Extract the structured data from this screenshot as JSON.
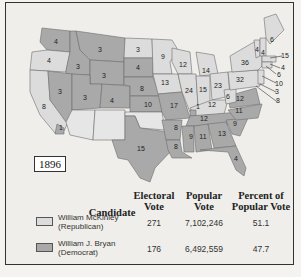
{
  "map": {
    "year_label": "1896",
    "states": [
      {
        "state": "WA",
        "ev": "4",
        "party": "dem"
      },
      {
        "state": "OR",
        "ev": "4",
        "party": "rep"
      },
      {
        "state": "CA",
        "ev": "8",
        "party": "rep"
      },
      {
        "state": "CA-split",
        "ev": "1",
        "party": "dem"
      },
      {
        "state": "ID",
        "ev": "3",
        "party": "dem"
      },
      {
        "state": "NV",
        "ev": "3",
        "party": "dem"
      },
      {
        "state": "MT",
        "ev": "3",
        "party": "dem"
      },
      {
        "state": "WY",
        "ev": "3",
        "party": "dem"
      },
      {
        "state": "UT",
        "ev": "3",
        "party": "dem"
      },
      {
        "state": "CO",
        "ev": "4",
        "party": "dem"
      },
      {
        "state": "ND",
        "ev": "3",
        "party": "rep"
      },
      {
        "state": "SD",
        "ev": "4",
        "party": "dem"
      },
      {
        "state": "NE",
        "ev": "8",
        "party": "dem"
      },
      {
        "state": "KS",
        "ev": "10",
        "party": "dem"
      },
      {
        "state": "TX",
        "ev": "15",
        "party": "dem"
      },
      {
        "state": "MN",
        "ev": "9",
        "party": "rep"
      },
      {
        "state": "IA",
        "ev": "13",
        "party": "rep"
      },
      {
        "state": "MO",
        "ev": "17",
        "party": "dem"
      },
      {
        "state": "AR",
        "ev": "8",
        "party": "dem"
      },
      {
        "state": "LA",
        "ev": "8",
        "party": "dem"
      },
      {
        "state": "WI",
        "ev": "12",
        "party": "rep"
      },
      {
        "state": "IL",
        "ev": "24",
        "party": "rep"
      },
      {
        "state": "MI",
        "ev": "14",
        "party": "rep"
      },
      {
        "state": "IN",
        "ev": "15",
        "party": "rep"
      },
      {
        "state": "OH",
        "ev": "23",
        "party": "rep"
      },
      {
        "state": "KY",
        "ev": "12",
        "party": "rep"
      },
      {
        "state": "KY-split",
        "ev": "1",
        "party": "dem"
      },
      {
        "state": "TN",
        "ev": "12",
        "party": "dem"
      },
      {
        "state": "MS",
        "ev": "9",
        "party": "dem"
      },
      {
        "state": "AL",
        "ev": "11",
        "party": "dem"
      },
      {
        "state": "GA",
        "ev": "13",
        "party": "dem"
      },
      {
        "state": "FL",
        "ev": "4",
        "party": "dem"
      },
      {
        "state": "SC",
        "ev": "9",
        "party": "dem"
      },
      {
        "state": "NC",
        "ev": "11",
        "party": "dem"
      },
      {
        "state": "VA",
        "ev": "12",
        "party": "dem"
      },
      {
        "state": "WV",
        "ev": "6",
        "party": "rep"
      },
      {
        "state": "PA",
        "ev": "32",
        "party": "rep"
      },
      {
        "state": "NY",
        "ev": "36",
        "party": "rep"
      },
      {
        "state": "VT",
        "ev": "4",
        "party": "rep"
      },
      {
        "state": "NH",
        "ev": "4",
        "party": "rep"
      },
      {
        "state": "ME",
        "ev": "6",
        "party": "rep"
      },
      {
        "state": "MA",
        "ev": "15",
        "party": "rep"
      },
      {
        "state": "RI",
        "ev": "4",
        "party": "rep"
      },
      {
        "state": "CT",
        "ev": "6",
        "party": "rep"
      },
      {
        "state": "NJ",
        "ev": "10",
        "party": "rep"
      },
      {
        "state": "DE",
        "ev": "3",
        "party": "rep"
      },
      {
        "state": "MD",
        "ev": "8",
        "party": "rep"
      }
    ]
  },
  "legend": {
    "headers": {
      "candidate": "Candidate",
      "electoral_1": "Electoral",
      "electoral_2": "Vote",
      "popular_1": "Popular",
      "popular_2": "Vote",
      "percent_1": "Percent of",
      "percent_2": "Popular Vote"
    },
    "rows": [
      {
        "name_1": "William McKinley",
        "name_2": "(Republican)",
        "electoral": "271",
        "popular": "7,102,246",
        "percent": "51.1",
        "color": "#dcdcdc"
      },
      {
        "name_1": "William J. Bryan",
        "name_2": "(Democrat)",
        "electoral": "176",
        "popular": "6,492,559",
        "percent": "47.7",
        "color": "#a9a9a9"
      }
    ]
  }
}
